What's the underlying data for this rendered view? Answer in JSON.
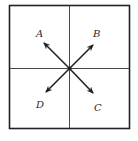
{
  "diagram": {
    "colors": {
      "stroke": "#222222",
      "background": "#ffffff"
    },
    "labels": {
      "a": "A",
      "b": "B",
      "c": "C",
      "d": "D"
    },
    "arrows": [
      {
        "label": "A",
        "direction": "up-left"
      },
      {
        "label": "B",
        "direction": "up-right"
      },
      {
        "label": "C",
        "direction": "down-right"
      },
      {
        "label": "D",
        "direction": "down-left"
      }
    ]
  }
}
